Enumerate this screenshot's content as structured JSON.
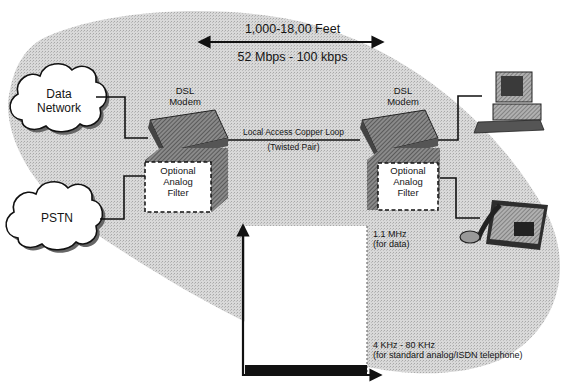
{
  "diagram": {
    "distance": {
      "range_label": "1,000-18,00 Feet",
      "rate_label": "52 Mbps - 100 kbps"
    },
    "clouds": [
      {
        "id": "data-network",
        "line1": "Data",
        "line2": "Network"
      },
      {
        "id": "pstn",
        "line1": "PSTN"
      }
    ],
    "modems": [
      {
        "side": "left",
        "line1": "DSL",
        "line2": "Modem"
      },
      {
        "side": "right",
        "line1": "DSL",
        "line2": "Modem"
      }
    ],
    "loop": {
      "line1": "Local Access Copper Loop",
      "line2": "(Twisted Pair)"
    },
    "filters": [
      {
        "side": "left",
        "line1": "Optional",
        "line2": "Analog",
        "line3": "Filter"
      },
      {
        "side": "right",
        "line1": "Optional",
        "line2": "Analog",
        "line3": "Filter"
      }
    ],
    "endpoints": [
      {
        "id": "computer",
        "icon": "computer-icon"
      },
      {
        "id": "telephone",
        "icon": "telephone-icon"
      }
    ],
    "spectrum": {
      "data_band": {
        "line1": "1.1 MHz",
        "line2": "(for data)"
      },
      "voice_band": {
        "line1": "4 KHz - 80 KHz",
        "line2": "(for standard analog/ISDN telephone)"
      }
    },
    "colors": {
      "background": "#ffffff",
      "shaded_region": "#d4d4d4",
      "ink": "#111111",
      "device_fill": "#6e6e6e"
    }
  }
}
